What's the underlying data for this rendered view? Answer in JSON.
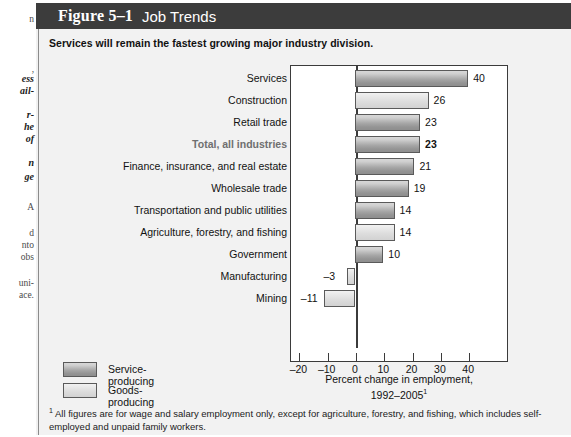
{
  "page_margin": {
    "lines": [
      {
        "text": "n",
        "style": "normal",
        "top": 14
      },
      {
        "text": ",",
        "style": "normal",
        "top": 64
      },
      {
        "text": "ess",
        "style": "bold",
        "top": 74
      },
      {
        "text": "ail-",
        "style": "bold",
        "top": 86
      },
      {
        "text": "r-",
        "style": "bold",
        "top": 110
      },
      {
        "text": "he",
        "style": "bold",
        "top": 122
      },
      {
        "text": "of",
        "style": "bold",
        "top": 134
      },
      {
        "text": "n",
        "style": "bold",
        "top": 158
      },
      {
        "text": "ge",
        "style": "bold",
        "top": 172
      },
      {
        "text": "A",
        "style": "normal",
        "top": 202
      },
      {
        "text": "d",
        "style": "normal",
        "top": 228
      },
      {
        "text": "nto",
        "style": "normal",
        "top": 240
      },
      {
        "text": "obs",
        "style": "normal",
        "top": 252
      },
      {
        "text": "uni-",
        "style": "normal",
        "top": 278
      },
      {
        "text": "ace.",
        "style": "normal",
        "top": 290
      }
    ]
  },
  "figure": {
    "number": "Figure 5–1",
    "title": "Job Trends",
    "subtitle": "Services will remain the fastest growing major industry division.",
    "footnote": "All figures are for wage and salary employment only, except for agriculture, forestry, and fishing, which includes self-employed and unpaid family workers.",
    "footnote_marker": "1"
  },
  "legend": {
    "position": "bottom-left",
    "items": [
      {
        "label": "Service-producing",
        "key": "service",
        "color": "#a0a0a0"
      },
      {
        "label": "Goods-producing",
        "key": "goods",
        "color": "#dedede"
      }
    ]
  },
  "chart_data": {
    "type": "bar",
    "orientation": "horizontal",
    "title": "Job Trends",
    "subtitle": "Services will remain the fastest growing major industry division.",
    "xlabel": "Percent change in employment, 1992–2005",
    "xlabel_line1": "Percent change in employment,",
    "xlabel_line2": "1992–2005",
    "xlabel_footnote_marker": "1",
    "ylabel": "",
    "xlim": [
      -20,
      45
    ],
    "xticks": [
      -20,
      -10,
      0,
      10,
      20,
      30,
      40
    ],
    "xticklabels": [
      "–20",
      "–10",
      "0",
      "10",
      "20",
      "30",
      "40"
    ],
    "grid": false,
    "categories": [
      "Services",
      "Construction",
      "Retail trade",
      "Total, all industries",
      "Finance, insurance, and real estate",
      "Wholesale trade",
      "Transportation and public utilities",
      "Agriculture, forestry, and fishing",
      "Government",
      "Manufacturing",
      "Mining"
    ],
    "values": [
      40,
      26,
      23,
      23,
      21,
      19,
      14,
      14,
      10,
      -3,
      -11
    ],
    "value_labels": [
      "40",
      "26",
      "23",
      "23",
      "21",
      "19",
      "14",
      "14",
      "10",
      "–3",
      "–11"
    ],
    "groups": [
      "service",
      "goods",
      "service",
      "service",
      "service",
      "service",
      "service",
      "goods",
      "service",
      "goods",
      "goods"
    ],
    "emphasis": [
      false,
      false,
      false,
      true,
      false,
      false,
      false,
      false,
      false,
      false,
      false
    ],
    "series": [
      {
        "name": "Percent change in employment, 1992-2005",
        "values": [
          40,
          26,
          23,
          23,
          21,
          19,
          14,
          14,
          10,
          -3,
          -11
        ]
      }
    ]
  }
}
